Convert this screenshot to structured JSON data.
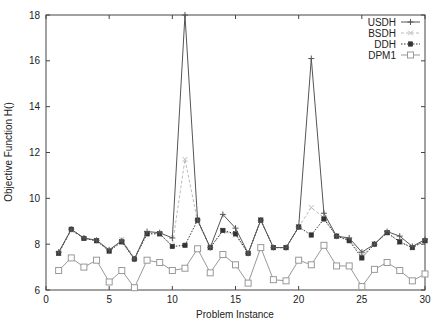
{
  "chart_data": {
    "type": "line",
    "title": "",
    "xlabel": "Problem Instance",
    "ylabel": "Objective Function H()",
    "xlim": [
      0,
      30
    ],
    "ylim": [
      6,
      18
    ],
    "xticks": [
      0,
      5,
      10,
      15,
      20,
      25,
      30
    ],
    "yticks": [
      6,
      8,
      10,
      12,
      14,
      16,
      18
    ],
    "grid": false,
    "legend_position": "top-right",
    "x": [
      1,
      2,
      3,
      4,
      5,
      6,
      7,
      8,
      9,
      10,
      11,
      12,
      13,
      14,
      15,
      16,
      17,
      18,
      19,
      20,
      21,
      22,
      23,
      24,
      25,
      26,
      27,
      28,
      29,
      30
    ],
    "series": [
      {
        "name": "USDH",
        "color": "#555555",
        "marker": "plus",
        "dash": "solid",
        "values": [
          7.65,
          8.65,
          8.27,
          8.17,
          7.75,
          8.15,
          7.35,
          8.55,
          8.5,
          8.27,
          18.0,
          9.05,
          7.85,
          9.3,
          8.7,
          7.6,
          9.05,
          7.85,
          7.85,
          8.75,
          16.1,
          9.35,
          8.35,
          8.27,
          7.65,
          8.0,
          8.55,
          8.35,
          7.9,
          8.2
        ]
      },
      {
        "name": "BSDH",
        "color": "#bbbbbb",
        "marker": "x",
        "dash": "dashed",
        "values": [
          7.6,
          8.6,
          8.25,
          8.15,
          7.7,
          8.2,
          7.4,
          8.5,
          8.45,
          7.95,
          11.7,
          9.0,
          7.85,
          8.55,
          8.4,
          7.6,
          9.05,
          7.85,
          7.85,
          8.75,
          9.6,
          9.15,
          8.35,
          8.2,
          7.5,
          8.0,
          8.5,
          8.1,
          7.85,
          8.15
        ]
      },
      {
        "name": "DDH",
        "color": "#333333",
        "marker": "filled-square",
        "dash": "dotted",
        "values": [
          7.6,
          8.65,
          8.25,
          8.15,
          7.7,
          8.1,
          7.35,
          8.45,
          8.45,
          7.9,
          7.95,
          9.05,
          7.85,
          8.6,
          8.45,
          7.6,
          9.05,
          7.85,
          7.85,
          8.75,
          8.4,
          9.1,
          8.35,
          8.15,
          7.4,
          8.0,
          8.5,
          8.1,
          7.85,
          8.15
        ]
      },
      {
        "name": "DPM1",
        "color": "#999999",
        "marker": "open-square",
        "dash": "solid",
        "values": [
          6.85,
          7.4,
          7.0,
          7.3,
          6.35,
          6.85,
          6.1,
          7.3,
          7.2,
          6.85,
          6.95,
          7.8,
          6.75,
          7.55,
          7.1,
          6.3,
          7.85,
          6.45,
          6.4,
          7.3,
          7.1,
          7.95,
          7.05,
          7.05,
          6.15,
          6.9,
          7.2,
          6.85,
          6.4,
          6.7
        ]
      }
    ]
  }
}
